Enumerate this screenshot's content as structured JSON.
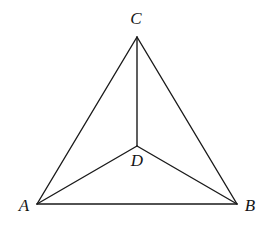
{
  "figure": {
    "background_color": "#ffffff",
    "line_color": "#1a1a1a",
    "label_color": "#151515",
    "canvas": {
      "width": 268,
      "height": 228
    }
  },
  "points": {
    "A": {
      "label": "A",
      "x": 37,
      "y": 204,
      "label_x": 24,
      "label_y": 205
    },
    "B": {
      "label": "B",
      "x": 237,
      "y": 204,
      "label_x": 250,
      "label_y": 205
    },
    "C": {
      "label": "C",
      "x": 137,
      "y": 37,
      "label_x": 136,
      "label_y": 18
    },
    "D": {
      "label": "D",
      "x": 137,
      "y": 146,
      "label_x": 137,
      "label_y": 160
    }
  },
  "segments": [
    {
      "name": "AB",
      "from": "A",
      "to": "B",
      "x1": 37,
      "y1": 204,
      "x2": 237,
      "y2": 204
    },
    {
      "name": "AC",
      "from": "A",
      "to": "C",
      "x1": 37,
      "y1": 204,
      "x2": 137,
      "y2": 37
    },
    {
      "name": "BC",
      "from": "B",
      "to": "C",
      "x1": 237,
      "y1": 204,
      "x2": 137,
      "y2": 37
    },
    {
      "name": "AD",
      "from": "A",
      "to": "D",
      "x1": 37,
      "y1": 204,
      "x2": 137,
      "y2": 146
    },
    {
      "name": "BD",
      "from": "B",
      "to": "D",
      "x1": 237,
      "y1": 204,
      "x2": 137,
      "y2": 146
    },
    {
      "name": "CD",
      "from": "C",
      "to": "D",
      "x1": 137,
      "y1": 37,
      "x2": 137,
      "y2": 146
    }
  ]
}
